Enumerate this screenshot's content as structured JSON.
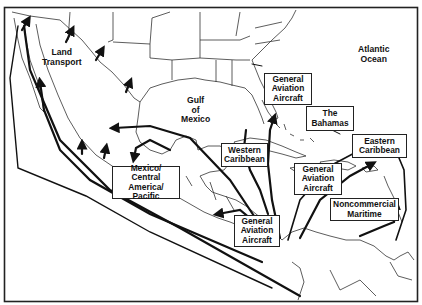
{
  "map": {
    "title": "",
    "colors": {
      "ink": "#111111",
      "paper": "#ffffff",
      "frame": "#222222"
    },
    "region_labels": [
      {
        "id": "land-transport",
        "lines": [
          "Land",
          "Transport"
        ]
      },
      {
        "id": "gulf-of-mexico",
        "lines": [
          "Gulf",
          "of",
          "Mexico"
        ]
      },
      {
        "id": "atlantic-ocean",
        "lines": [
          "Atlantic",
          "Ocean"
        ]
      }
    ],
    "route_boxes": [
      {
        "id": "general-aviation-florida",
        "lines": [
          "General",
          "Aviation",
          "Aircraft"
        ]
      },
      {
        "id": "the-bahamas",
        "lines": [
          "The",
          "Bahamas"
        ]
      },
      {
        "id": "eastern-caribbean",
        "lines": [
          "Eastern",
          "Caribbean"
        ]
      },
      {
        "id": "western-caribbean",
        "lines": [
          "Western",
          "Caribbean"
        ]
      },
      {
        "id": "general-aviation-caribbean",
        "lines": [
          "General",
          "Aviation",
          "Aircraft"
        ]
      },
      {
        "id": "mexico-central-america-pacific",
        "lines": [
          "Mexico/",
          "Central America/",
          "Pacific"
        ]
      },
      {
        "id": "general-aviation-central-america",
        "lines": [
          "General",
          "Aviation",
          "Aircraft"
        ]
      },
      {
        "id": "noncommercial-maritime",
        "lines": [
          "Noncommercial",
          "Maritime"
        ]
      }
    ]
  }
}
